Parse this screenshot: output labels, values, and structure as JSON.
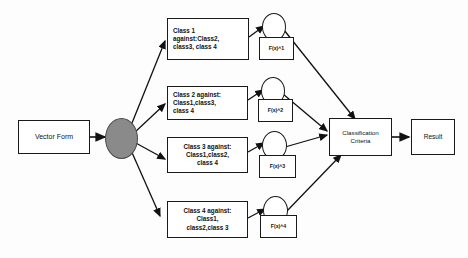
{
  "diagram": {
    "background_color": "#fdfdfd",
    "stroke_color": "#1a1a1a",
    "hub_fill_color": "#8a8a8a",
    "node_fill_color": "#ffffff",
    "input": {
      "label": "Vector Form"
    },
    "hub": {
      "label": "",
      "icon_name": "splitter-node"
    },
    "classes": [
      {
        "id": "class-1",
        "label": "Class 1\nagainst:Class2,\nclass3,  class 4",
        "align": "left"
      },
      {
        "id": "class-2",
        "label": "Class 2 against:\nClass1,class3,\nclass 4",
        "align": "left"
      },
      {
        "id": "class-3",
        "label": "Class 3 against:\nClass1,class2,\nclass 4",
        "align": "center"
      },
      {
        "id": "class-4",
        "label": "Class 4 against:\nClass1,\nclass2,class 3",
        "align": "center"
      }
    ],
    "functions": [
      {
        "id": "fx-1",
        "label": "F(x)^1"
      },
      {
        "id": "fx-2",
        "label": "F(x)^2"
      },
      {
        "id": "fx-3",
        "label": "F(x)^3"
      },
      {
        "id": "fx-4",
        "label": "F(x)^4"
      }
    ],
    "criteria": {
      "label": "Classification\nCriteria"
    },
    "result": {
      "label": "Result"
    }
  }
}
